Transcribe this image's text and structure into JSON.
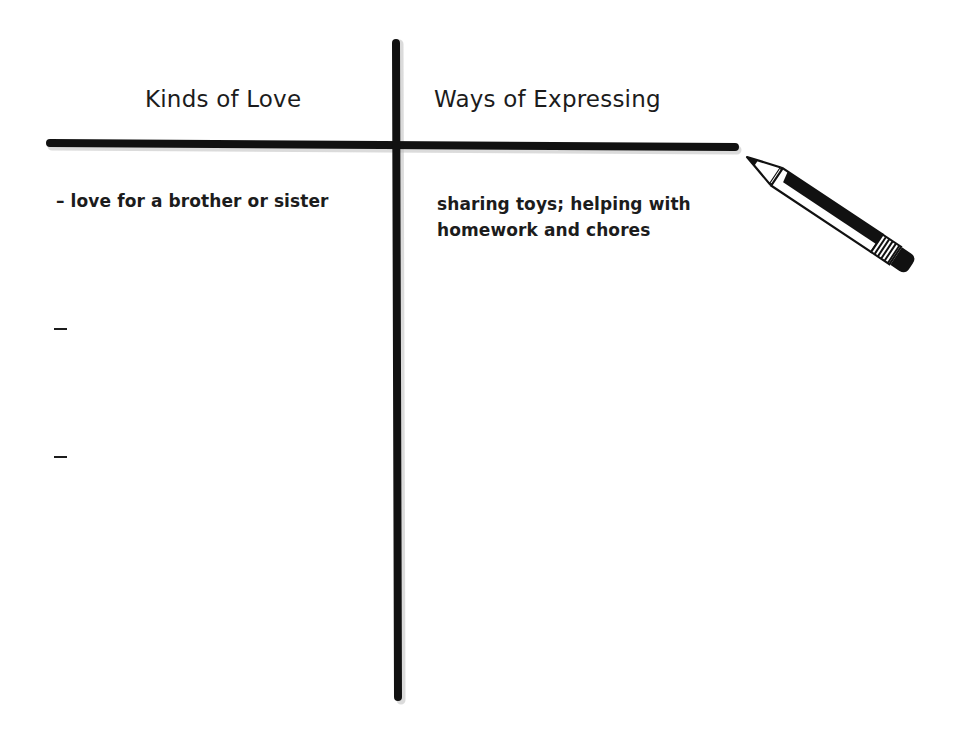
{
  "chart": {
    "type": "t-chart",
    "columns": [
      {
        "heading": "Kinds of Love"
      },
      {
        "heading": "Ways of Expressing"
      }
    ],
    "rows": [
      {
        "kind": "– love for a brother or sister",
        "expression": "sharing toys; helping with homework and chores"
      },
      {
        "kind": "–",
        "expression": ""
      },
      {
        "kind": "–",
        "expression": ""
      }
    ]
  },
  "decorations": {
    "pencil_icon": "pencil-icon",
    "line_color": "#111111"
  }
}
